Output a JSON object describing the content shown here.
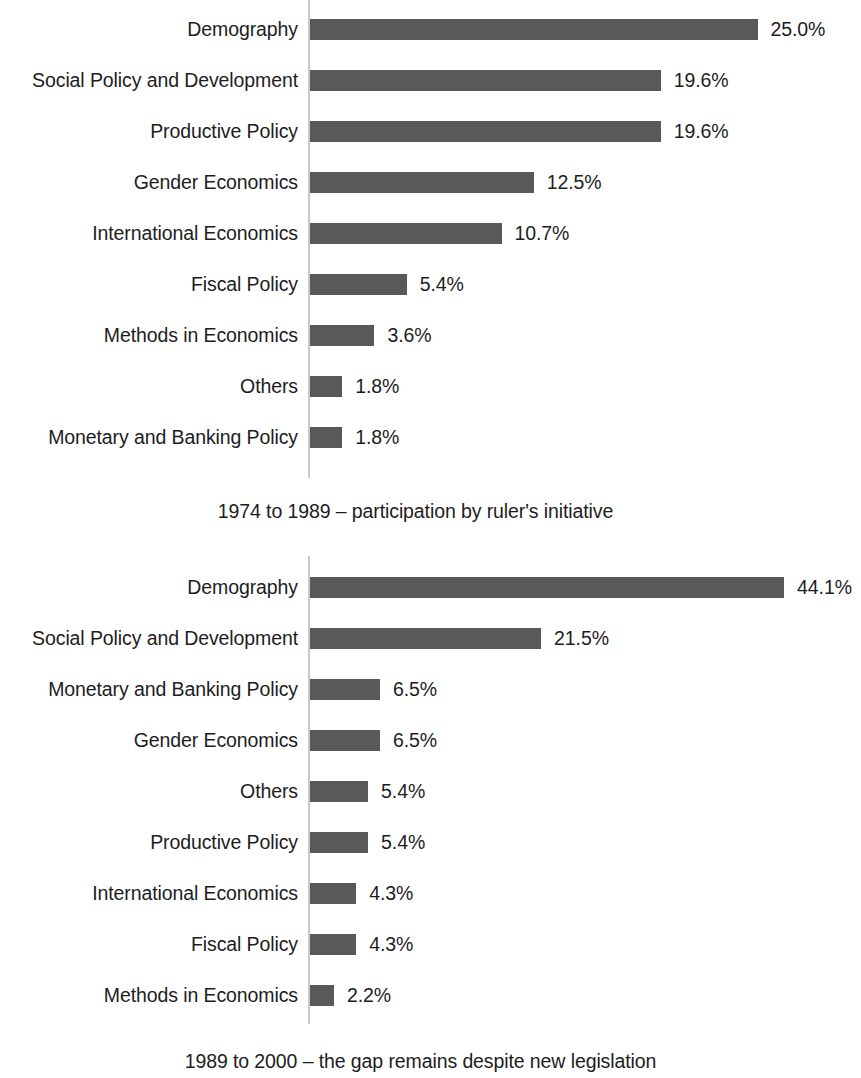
{
  "colors": {
    "bar": "#595959",
    "axis": "#c9c9c9",
    "text": "#1d1d1d",
    "background": "#ffffff"
  },
  "chart_data": [
    {
      "type": "bar",
      "orientation": "horizontal",
      "title": "",
      "caption": "1974 to 1989 – participation by ruler's initiative",
      "xlabel": "",
      "ylabel": "",
      "grid": false,
      "legend": "none",
      "value_suffix": "%",
      "xlim": [
        0,
        25.0
      ],
      "px_per_unit": 17.9,
      "categories": [
        "Demography",
        "Social Policy and Development",
        "Productive Policy",
        "Gender Economics",
        "International Economics",
        "Fiscal Policy",
        "Methods in Economics",
        "Others",
        "Monetary and Banking Policy"
      ],
      "values": [
        25.0,
        19.6,
        19.6,
        12.5,
        10.7,
        5.4,
        3.6,
        1.8,
        1.8
      ],
      "labels": [
        "25.0%",
        "19.6%",
        "19.6%",
        "12.5%",
        "10.7%",
        "5.4%",
        "3.6%",
        "1.8%",
        "1.8%"
      ]
    },
    {
      "type": "bar",
      "orientation": "horizontal",
      "title": "",
      "caption": "1989 to 2000 – the gap remains despite new legislation",
      "xlabel": "",
      "ylabel": "",
      "grid": false,
      "legend": "none",
      "value_suffix": "%",
      "xlim": [
        0,
        44.1
      ],
      "px_per_unit": 10.75,
      "categories": [
        "Demography",
        "Social Policy and Development",
        "Monetary and Banking Policy",
        "Gender Economics",
        "Others",
        "Productive Policy",
        "International Economics",
        "Fiscal Policy",
        "Methods in Economics"
      ],
      "values": [
        44.1,
        21.5,
        6.5,
        6.5,
        5.4,
        5.4,
        4.3,
        4.3,
        2.2
      ],
      "labels": [
        "44.1%",
        "21.5%",
        "6.5%",
        "6.5%",
        "5.4%",
        "5.4%",
        "4.3%",
        "4.3%",
        "2.2%"
      ]
    }
  ]
}
